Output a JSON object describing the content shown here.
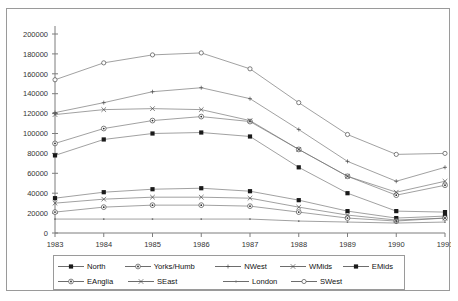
{
  "top_strip": {
    "cut_text": " "
  },
  "chart_data": {
    "type": "line",
    "title": "",
    "subtitle": "",
    "xlabel": "",
    "ylabel": "",
    "categories": [
      1983,
      1984,
      1985,
      1986,
      1987,
      1988,
      1989,
      1990,
      1991
    ],
    "tick_labels_x": [
      "1983",
      "1984",
      "1985",
      "1986",
      "1987",
      "1988",
      "1989",
      "1990",
      "1991"
    ],
    "tick_labels_y": [
      "0",
      "20000",
      "40000",
      "60000",
      "80000",
      "100000",
      "120000",
      "140000",
      "160000",
      "180000",
      "200000"
    ],
    "ylim": [
      0,
      200000
    ],
    "ytick_step": 20000,
    "grid": false,
    "legend_position": "bottom",
    "series": [
      {
        "name": "North",
        "marker": "filled-square",
        "values": [
          78000,
          94000,
          100000,
          101000,
          97000,
          66000,
          40000,
          22000,
          21000
        ]
      },
      {
        "name": "Yorks/Humb",
        "marker": "circle-dot",
        "values": [
          90000,
          105000,
          113000,
          117000,
          112000,
          84000,
          57000,
          38000,
          48000
        ]
      },
      {
        "name": "NWest",
        "marker": "small-plus",
        "values": [
          121000,
          131000,
          142000,
          146000,
          135000,
          104000,
          72000,
          52000,
          66000
        ]
      },
      {
        "name": "WMids",
        "marker": "cross",
        "values": [
          119000,
          124000,
          125000,
          124000,
          113000,
          84000,
          57000,
          41000,
          52000
        ]
      },
      {
        "name": "EMids",
        "marker": "filled-square",
        "values": [
          35000,
          41000,
          44000,
          45000,
          42000,
          33000,
          22000,
          15000,
          17000
        ]
      },
      {
        "name": "EAnglia",
        "marker": "circle-dot",
        "values": [
          21000,
          26000,
          28000,
          28000,
          27000,
          21000,
          15000,
          12000,
          15000
        ]
      },
      {
        "name": "SEast",
        "marker": "cross",
        "values": [
          30000,
          34000,
          36000,
          36000,
          35000,
          26000,
          18000,
          13000,
          15000
        ]
      },
      {
        "name": "London",
        "marker": "tiny-dot",
        "values": [
          14000,
          14000,
          14000,
          14000,
          14000,
          12000,
          11000,
          10000,
          11000
        ]
      },
      {
        "name": "SWest",
        "marker": "open-circle",
        "values": [
          154000,
          171000,
          179000,
          181000,
          165000,
          131000,
          99000,
          79000,
          80000
        ]
      }
    ]
  },
  "legend": {
    "rows": [
      [
        "North",
        "Yorks/Humb",
        "NWest",
        "WMids",
        "EMids"
      ],
      [
        "EAnglia",
        "SEast",
        "London",
        "SWest"
      ]
    ]
  }
}
